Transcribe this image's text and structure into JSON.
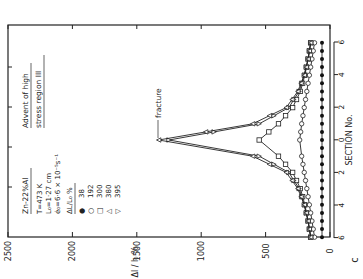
{
  "figure": {
    "panel_label": "c",
    "annotation_top": "Advent of high",
    "annotation_bottom": "stress region III",
    "fracture_label": "fracture",
    "legend": {
      "material": "Zn-22%Al",
      "temperature": "T=473 K",
      "gauge_length": "L₀=1·27 cm",
      "strain_rate": "ė₀=6·6 × 10⁻⁵s⁻¹",
      "header": "ΔL/L₀ %",
      "entries": [
        {
          "marker": "●",
          "label": "38"
        },
        {
          "marker": "○",
          "label": "192"
        },
        {
          "marker": "□",
          "label": "300"
        },
        {
          "marker": "△",
          "label": "380"
        },
        {
          "marker": "▽",
          "label": "395"
        }
      ]
    },
    "value_axis_title": "Δl / l₀ %",
    "section_axis_title": "SECTION No.",
    "value_ticks": [
      "2500",
      "2000",
      "1500",
      "1000",
      "500",
      "0"
    ],
    "section_ticks": [
      "6",
      "4",
      "2",
      "0",
      "2",
      "4",
      "6"
    ]
  },
  "chart_data": {
    "type": "line",
    "title": "",
    "orientation": "rotated 90° (value axis horizontal, section axis vertical)",
    "xlabel": "SECTION No.",
    "ylabel": "Δl/l₀ %",
    "ylim": [
      0,
      2500
    ],
    "x": [
      -6,
      -5,
      -4,
      -3,
      -2,
      -1,
      0,
      1,
      2,
      3,
      4,
      5,
      6
    ],
    "series": [
      {
        "name": "38",
        "marker": "filled-circle",
        "values": [
          60,
          60,
          60,
          60,
          60,
          60,
          60,
          60,
          60,
          60,
          60,
          60,
          60
        ]
      },
      {
        "name": "192",
        "marker": "open-circle",
        "values": [
          120,
          140,
          160,
          180,
          200,
          220,
          235,
          220,
          200,
          180,
          160,
          140,
          120
        ]
      },
      {
        "name": "300",
        "marker": "open-square",
        "values": [
          150,
          170,
          195,
          230,
          290,
          400,
          550,
          400,
          290,
          230,
          195,
          170,
          150
        ]
      },
      {
        "name": "380",
        "marker": "open-triangle-up",
        "values": [
          150,
          170,
          200,
          240,
          320,
          550,
          1250,
          550,
          320,
          240,
          200,
          170,
          150
        ]
      },
      {
        "name": "395",
        "marker": "open-triangle-down",
        "values": [
          150,
          170,
          200,
          250,
          340,
          600,
          1330,
          600,
          340,
          250,
          200,
          170,
          150
        ]
      }
    ],
    "annotations": [
      "fracture (at section 0, curve 395)",
      "Advent of high stress region III"
    ],
    "legend_position": "upper-left (rotated)",
    "grid": false
  }
}
